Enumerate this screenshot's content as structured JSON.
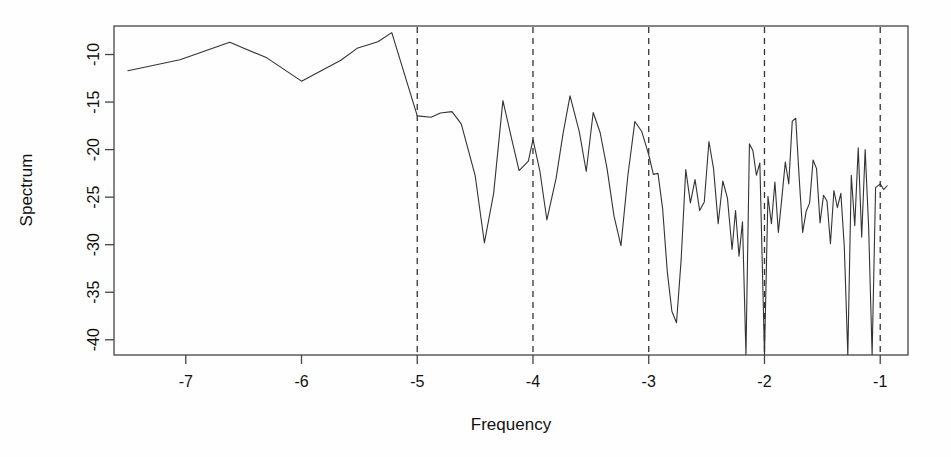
{
  "chart_data": {
    "type": "line",
    "title": "",
    "subtitle": "",
    "xlabel": "Frequency",
    "ylabel": "Spectrum",
    "xlim": [
      -7.62,
      -0.76
    ],
    "ylim": [
      -41.6,
      -7.0
    ],
    "xticks": [
      -7,
      -6,
      -5,
      -4,
      -3,
      -2,
      -1
    ],
    "xtick_labels": [
      "-7",
      "-6",
      "-5",
      "-4",
      "-3",
      "-2",
      "-1"
    ],
    "yticks": [
      -40,
      -35,
      -30,
      -25,
      -20,
      -15,
      -10
    ],
    "ytick_labels": [
      "-40",
      "-35",
      "-30",
      "-25",
      "-20",
      "-15",
      "-10"
    ],
    "grid": false,
    "legend": false,
    "legend_position": "none",
    "line_color": "#333333",
    "line_width": 1.1,
    "box_color": "#444444",
    "vlines": {
      "style": "dashed",
      "color": "#333333",
      "x": [
        -5,
        -4,
        -3,
        -2,
        -1
      ]
    },
    "series": [
      {
        "name": "spectrum",
        "points": [
          [
            -7.5,
            -11.7
          ],
          [
            -7.05,
            -10.55
          ],
          [
            -6.62,
            -8.7
          ],
          [
            -6.3,
            -10.35
          ],
          [
            -6.0,
            -12.8
          ],
          [
            -5.66,
            -10.6
          ],
          [
            -5.52,
            -9.35
          ],
          [
            -5.34,
            -8.65
          ],
          [
            -5.22,
            -7.7
          ],
          [
            -5.0,
            -16.45
          ],
          [
            -4.88,
            -16.6
          ],
          [
            -4.8,
            -16.15
          ],
          [
            -4.7,
            -16.0
          ],
          [
            -4.62,
            -17.3
          ],
          [
            -4.5,
            -22.7
          ],
          [
            -4.42,
            -29.8
          ],
          [
            -4.34,
            -24.6
          ],
          [
            -4.26,
            -14.85
          ],
          [
            -4.18,
            -19.1
          ],
          [
            -4.12,
            -22.2
          ],
          [
            -4.04,
            -21.2
          ],
          [
            -4.0,
            -18.95
          ],
          [
            -3.94,
            -22.3
          ],
          [
            -3.88,
            -27.4
          ],
          [
            -3.8,
            -23.0
          ],
          [
            -3.74,
            -18.3
          ],
          [
            -3.68,
            -14.35
          ],
          [
            -3.6,
            -18.1
          ],
          [
            -3.54,
            -22.3
          ],
          [
            -3.48,
            -16.1
          ],
          [
            -3.42,
            -18.2
          ],
          [
            -3.36,
            -22.0
          ],
          [
            -3.3,
            -27.0
          ],
          [
            -3.24,
            -30.1
          ],
          [
            -3.18,
            -22.7
          ],
          [
            -3.12,
            -17.05
          ],
          [
            -3.06,
            -18.1
          ],
          [
            -3.0,
            -20.55
          ],
          [
            -2.96,
            -22.6
          ],
          [
            -2.92,
            -22.5
          ],
          [
            -2.88,
            -26.2
          ],
          [
            -2.84,
            -32.8
          ],
          [
            -2.8,
            -37.0
          ],
          [
            -2.76,
            -38.2
          ],
          [
            -2.72,
            -31.6
          ],
          [
            -2.68,
            -22.1
          ],
          [
            -2.64,
            -25.6
          ],
          [
            -2.6,
            -23.15
          ],
          [
            -2.56,
            -26.4
          ],
          [
            -2.52,
            -25.5
          ],
          [
            -2.48,
            -19.15
          ],
          [
            -2.44,
            -22.0
          ],
          [
            -2.4,
            -27.8
          ],
          [
            -2.36,
            -23.3
          ],
          [
            -2.32,
            -25.1
          ],
          [
            -2.28,
            -30.5
          ],
          [
            -2.25,
            -26.4
          ],
          [
            -2.22,
            -31.2
          ],
          [
            -2.19,
            -27.6
          ],
          [
            -2.16,
            -41.6
          ],
          [
            -2.13,
            -19.4
          ],
          [
            -2.1,
            -20.1
          ],
          [
            -2.07,
            -22.7
          ],
          [
            -2.04,
            -21.4
          ],
          [
            -2.0,
            -41.6
          ],
          [
            -1.97,
            -24.9
          ],
          [
            -1.94,
            -27.8
          ],
          [
            -1.91,
            -23.4
          ],
          [
            -1.88,
            -28.7
          ],
          [
            -1.85,
            -25.1
          ],
          [
            -1.82,
            -21.3
          ],
          [
            -1.79,
            -23.6
          ],
          [
            -1.76,
            -17.0
          ],
          [
            -1.73,
            -16.7
          ],
          [
            -1.7,
            -23.0
          ],
          [
            -1.67,
            -28.7
          ],
          [
            -1.64,
            -26.5
          ],
          [
            -1.61,
            -25.6
          ],
          [
            -1.58,
            -21.1
          ],
          [
            -1.55,
            -22.0
          ],
          [
            -1.52,
            -27.7
          ],
          [
            -1.49,
            -24.8
          ],
          [
            -1.46,
            -25.4
          ],
          [
            -1.43,
            -29.9
          ],
          [
            -1.4,
            -24.3
          ],
          [
            -1.37,
            -26.1
          ],
          [
            -1.34,
            -24.6
          ],
          [
            -1.31,
            -30.3
          ],
          [
            -1.28,
            -41.6
          ],
          [
            -1.25,
            -22.7
          ],
          [
            -1.22,
            -28.0
          ],
          [
            -1.19,
            -19.8
          ],
          [
            -1.16,
            -29.2
          ],
          [
            -1.13,
            -20.0
          ],
          [
            -1.1,
            -28.2
          ],
          [
            -1.07,
            -41.6
          ],
          [
            -1.04,
            -24.0
          ],
          [
            -1.0,
            -23.6
          ],
          [
            -0.97,
            -24.2
          ],
          [
            -0.94,
            -23.8
          ]
        ]
      }
    ]
  }
}
